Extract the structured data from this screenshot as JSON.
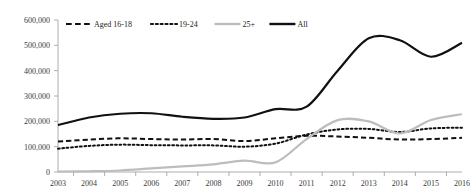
{
  "chart_data": {
    "type": "line",
    "title": "",
    "subtitle": "",
    "xlabel": "",
    "ylabel": "",
    "grid": false,
    "legend_position": "top-inside",
    "x": [
      2003,
      2004,
      2005,
      2006,
      2007,
      2008,
      2009,
      2010,
      2011,
      2012,
      2013,
      2014,
      2015,
      2016
    ],
    "categories": [
      "2003",
      "2004",
      "2005",
      "2006",
      "2007",
      "2008",
      "2009",
      "2010",
      "2011",
      "2012",
      "2013",
      "2014",
      "2015",
      "2016"
    ],
    "xlim": [
      2003,
      2016
    ],
    "ylim": [
      0,
      600000
    ],
    "ytick_values": [
      0,
      100000,
      200000,
      300000,
      400000,
      500000,
      600000
    ],
    "ytick_labels": [
      "0",
      "100,000",
      "200,000",
      "300,000",
      "400,000",
      "500,000",
      "600,000"
    ],
    "series": [
      {
        "name": "Aged 16-18",
        "style": "dashed",
        "color": "#111111",
        "values": [
          120000,
          128000,
          133000,
          130000,
          128000,
          130000,
          122000,
          133000,
          143000,
          140000,
          135000,
          128000,
          130000,
          135000
        ]
      },
      {
        "name": "19-24",
        "style": "dotted",
        "color": "#111111",
        "values": [
          92000,
          103000,
          108000,
          106000,
          105000,
          105000,
          100000,
          112000,
          148000,
          168000,
          170000,
          158000,
          172000,
          175000
        ]
      },
      {
        "name": "25+",
        "style": "solid",
        "color": "#bdbdbd",
        "values": [
          2000,
          3000,
          6000,
          14000,
          22000,
          30000,
          45000,
          38000,
          130000,
          205000,
          200000,
          152000,
          205000,
          228000
        ]
      },
      {
        "name": "All",
        "style": "solid",
        "color": "#111111",
        "values": [
          185000,
          215000,
          230000,
          232000,
          218000,
          210000,
          215000,
          248000,
          258000,
          400000,
          528000,
          520000,
          455000,
          510000
        ]
      }
    ],
    "legend": [
      {
        "label": "Aged 16-18",
        "style": "dashed",
        "color": "#111111"
      },
      {
        "label": "19-24",
        "style": "dotted",
        "color": "#111111"
      },
      {
        "label": "25+",
        "style": "solid",
        "color": "#bdbdbd"
      },
      {
        "label": "All",
        "style": "solid",
        "color": "#111111"
      }
    ]
  }
}
